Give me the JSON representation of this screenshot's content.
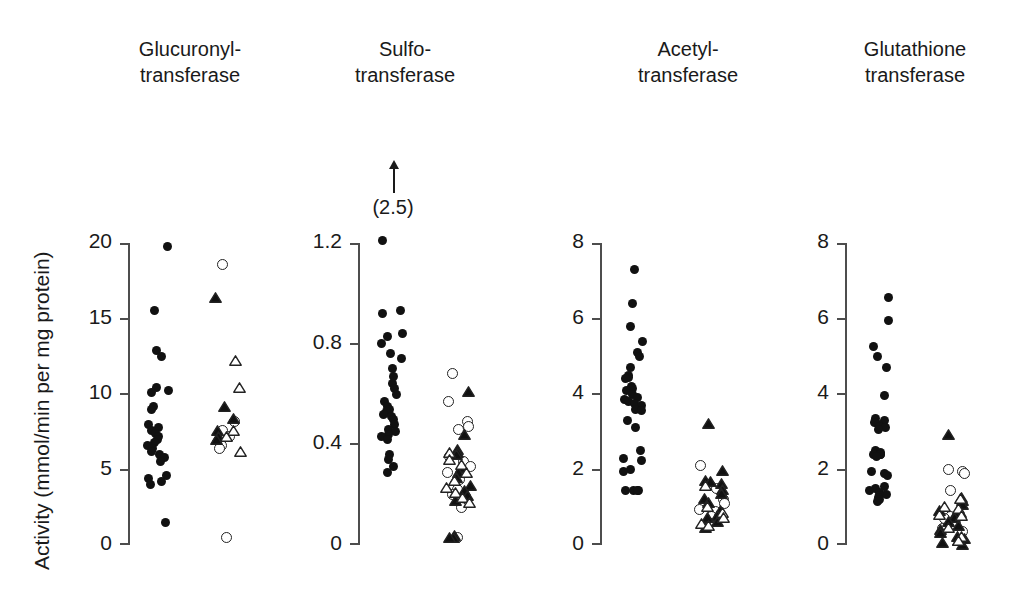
{
  "figure": {
    "ylabel": "Activity (mmol/min per mg protein)",
    "marker_legend": {
      "filled_circle": "filled-circle",
      "open_circle": "open-circle",
      "filled_triangle": "filled-triangle",
      "open_triangle": "open-triangle"
    }
  },
  "chart_data": {
    "type": "scatter",
    "title": "",
    "ylabel": "Activity (mmol/min per mg protein)",
    "xlabel": "",
    "grid": false,
    "legend": "none",
    "panels": [
      {
        "name": "glucuronyltransferase",
        "title": "Glucuronyl-\ntransferase",
        "ylim": [
          0,
          20
        ],
        "yticks": [
          0,
          5,
          10,
          15,
          20
        ],
        "yticklabels": [
          "0",
          "5",
          "10",
          "15",
          "20"
        ],
        "groups": [
          {
            "name": "group-1",
            "marker": "filled-circle",
            "values": [
              19.8,
              15.5,
              12.9,
              12.5,
              10.4,
              10.2,
              10.1,
              9.2,
              9.0,
              8.0,
              7.8,
              7.6,
              7.4,
              7.2,
              7.0,
              6.8,
              6.6,
              6.4,
              6.2,
              6.0,
              5.8,
              5.5,
              4.6,
              4.4,
              4.2,
              4.0,
              1.5
            ]
          },
          {
            "name": "group-2",
            "marker": "open-circle",
            "values": [
              18.6,
              8.2,
              7.6,
              7.2,
              7.0,
              6.6,
              6.4,
              0.5
            ]
          },
          {
            "name": "group-2",
            "marker": "filled-triangle",
            "values": [
              16.6,
              9.4,
              8.6,
              7.8,
              7.4,
              7.2
            ]
          },
          {
            "name": "group-2",
            "marker": "open-triangle",
            "values": [
              12.4,
              10.6,
              7.8,
              7.4,
              6.4
            ]
          }
        ]
      },
      {
        "name": "sulfotransferase",
        "title": "Sulfo-\ntransferase",
        "ylim": [
          0,
          1.2
        ],
        "yticks": [
          0,
          0.4,
          0.8,
          1.2
        ],
        "yticklabels": [
          "0",
          "0.4",
          "0.8",
          "1.2"
        ],
        "annotation": {
          "label": "(2.5)",
          "arrow": "up-arrow"
        },
        "groups": [
          {
            "name": "group-1",
            "marker": "filled-circle",
            "values": [
              1.21,
              0.93,
              0.92,
              0.84,
              0.83,
              0.8,
              0.76,
              0.74,
              0.7,
              0.67,
              0.64,
              0.62,
              0.6,
              0.57,
              0.55,
              0.54,
              0.53,
              0.52,
              0.51,
              0.5,
              0.48,
              0.46,
              0.45,
              0.44,
              0.43,
              0.42,
              0.36,
              0.34,
              0.31,
              0.29
            ]
          },
          {
            "name": "group-2",
            "marker": "open-circle",
            "values": [
              0.68,
              0.57,
              0.49,
              0.47,
              0.46,
              0.35,
              0.33,
              0.31,
              0.29,
              0.26,
              0.22,
              0.2,
              0.17,
              0.15,
              0.03
            ]
          },
          {
            "name": "group-2",
            "marker": "filled-triangle",
            "values": [
              0.62,
              0.45,
              0.39,
              0.38,
              0.37,
              0.32,
              0.3,
              0.28,
              0.25,
              0.23,
              0.21,
              0.19,
              0.05,
              0.04,
              0.04
            ]
          },
          {
            "name": "group-2",
            "marker": "open-triangle",
            "values": [
              0.38,
              0.35,
              0.33,
              0.3,
              0.27,
              0.24,
              0.22,
              0.2,
              0.18
            ]
          }
        ]
      },
      {
        "name": "acetyltransferase",
        "title": "Acetyl-\ntransferase",
        "ylim": [
          0,
          8
        ],
        "yticks": [
          0,
          2,
          4,
          6,
          8
        ],
        "yticklabels": [
          "0",
          "2",
          "4",
          "6",
          "8"
        ],
        "groups": [
          {
            "name": "group-1",
            "marker": "filled-circle",
            "values": [
              7.3,
              6.4,
              5.8,
              5.4,
              5.1,
              5.0,
              4.7,
              4.5,
              4.45,
              4.4,
              4.2,
              4.15,
              4.1,
              4.0,
              3.9,
              3.85,
              3.8,
              3.75,
              3.7,
              3.6,
              3.55,
              3.3,
              3.1,
              2.5,
              2.3,
              2.25,
              2.0,
              1.95,
              1.45,
              1.45,
              1.45,
              1.45
            ]
          },
          {
            "name": "group-2",
            "marker": "open-circle",
            "values": [
              2.1,
              1.6,
              1.5,
              1.2,
              1.1,
              0.95,
              0.9,
              0.75,
              0.6
            ]
          },
          {
            "name": "group-2",
            "marker": "filled-triangle",
            "values": [
              3.3,
              2.05,
              1.8,
              1.75,
              1.7,
              1.55,
              1.45,
              1.3,
              1.2,
              1.0,
              0.85,
              0.8,
              0.7,
              0.55
            ]
          },
          {
            "name": "group-2",
            "marker": "open-triangle",
            "values": [
              1.65,
              1.1,
              0.95,
              0.8,
              0.65,
              0.6
            ]
          }
        ]
      },
      {
        "name": "glutathione-transferase",
        "title": "Glutathione\ntransferase",
        "ylim": [
          0,
          8
        ],
        "yticks": [
          0,
          2,
          4,
          6,
          8
        ],
        "yticklabels": [
          "0",
          "2",
          "4",
          "6",
          "8"
        ],
        "groups": [
          {
            "name": "group-1",
            "marker": "filled-circle",
            "values": [
              6.55,
              5.95,
              5.25,
              5.0,
              4.7,
              3.95,
              3.35,
              3.3,
              3.25,
              3.2,
              3.15,
              3.1,
              3.05,
              2.5,
              2.45,
              2.4,
              2.4,
              2.4,
              2.4,
              2.35,
              1.95,
              1.9,
              1.85,
              1.55,
              1.5,
              1.45,
              1.4,
              1.35,
              1.3,
              1.25,
              1.2,
              1.15
            ]
          },
          {
            "name": "group-2",
            "marker": "open-circle",
            "values": [
              2.0,
              1.95,
              1.9,
              1.45,
              0.75,
              0.7,
              0.45,
              0.35
            ]
          },
          {
            "name": "group-2",
            "marker": "filled-triangle",
            "values": [
              3.0,
              1.35,
              1.25,
              1.15,
              1.0,
              0.95,
              0.9,
              0.8,
              0.7,
              0.6,
              0.5,
              0.4,
              0.3,
              0.25,
              0.2,
              0.15,
              0.1
            ]
          },
          {
            "name": "group-2",
            "marker": "open-triangle",
            "values": [
              1.3,
              1.1,
              1.05,
              0.9,
              0.85,
              0.55,
              0.3,
              0.2
            ]
          }
        ]
      }
    ]
  }
}
